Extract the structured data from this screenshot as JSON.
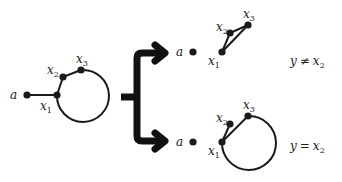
{
  "diagram": {
    "left_graph": {
      "nodes": [
        {
          "id": "a",
          "label": "a"
        },
        {
          "id": "x1",
          "label": "x",
          "sub": "1"
        },
        {
          "id": "x2",
          "label": "x",
          "sub": "2"
        },
        {
          "id": "x3",
          "label": "x",
          "sub": "3"
        }
      ],
      "edges": [
        [
          "a",
          "x1"
        ],
        [
          "x1",
          "x2"
        ],
        [
          "x2",
          "x3"
        ],
        [
          "x3",
          "x1",
          "loop-arc"
        ]
      ]
    },
    "branch_top": {
      "nodes": [
        {
          "id": "a",
          "label": "a"
        },
        {
          "id": "x1",
          "label": "x",
          "sub": "1"
        },
        {
          "id": "x2",
          "label": "x",
          "sub": "2"
        },
        {
          "id": "x3",
          "label": "x",
          "sub": "3"
        }
      ],
      "edges": [
        [
          "x1",
          "x2"
        ],
        [
          "x2",
          "x3"
        ],
        [
          "x1",
          "x3"
        ]
      ],
      "condition": {
        "lhs": "y",
        "op": "≠",
        "rhs": "x",
        "rhs_sub": "2"
      }
    },
    "branch_bottom": {
      "nodes": [
        {
          "id": "a",
          "label": "a"
        },
        {
          "id": "x1",
          "label": "x",
          "sub": "1"
        },
        {
          "id": "x2",
          "label": "x",
          "sub": "2"
        },
        {
          "id": "x3",
          "label": "x",
          "sub": "3"
        }
      ],
      "edges": [
        [
          "x1",
          "x2"
        ],
        [
          "x1",
          "x3"
        ],
        [
          "x3",
          "x1",
          "loop-arc"
        ]
      ],
      "condition": {
        "lhs": "y",
        "op": "=",
        "rhs": "x",
        "rhs_sub": "2"
      }
    },
    "colors": {
      "stroke": "#1a1a1a",
      "brace": "#111111"
    }
  }
}
